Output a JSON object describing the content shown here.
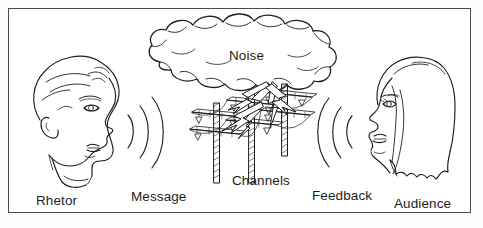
{
  "diagram": {
    "type": "line-art illustration",
    "background_color": "#ffffff",
    "line_color": "#1d1d1d",
    "border_color": "#4a4a4a",
    "labels": {
      "rhetor": "Rhetor",
      "message": "Message",
      "channels": "Channels",
      "feedback": "Feedback",
      "audience": "Audience",
      "noise": "Noise"
    },
    "elements": [
      {
        "name": "rhetor-head",
        "description": "male head in right-facing profile with hair, ear, eye, nose, smiling mouth and collar"
      },
      {
        "name": "message-waves",
        "description": "three concentric sound arcs opening rightward from the rhetor's mouth"
      },
      {
        "name": "noise-cloud",
        "description": "large billowy cloud outline at top center containing the word Noise"
      },
      {
        "name": "channels-towers",
        "description": "three hatched electrical transmission towers with crossarms and insulators"
      },
      {
        "name": "lightning-bolts",
        "description": "zigzag lightning bolts striking down from the cloud across the towers"
      },
      {
        "name": "feedback-waves",
        "description": "three concentric sound arcs opening leftward toward the audience"
      },
      {
        "name": "audience-head",
        "description": "female head in left-facing profile with long wavy hair, eye, nose and lips"
      }
    ]
  }
}
